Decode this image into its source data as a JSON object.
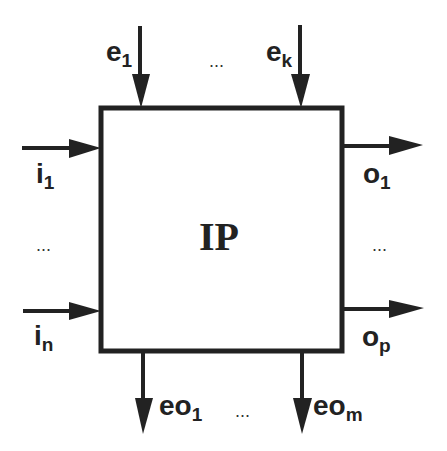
{
  "diagram": {
    "block": {
      "label": "IP"
    },
    "event_inputs": [
      {
        "base": "e",
        "sub": "1"
      },
      {
        "base": "e",
        "sub": "k"
      }
    ],
    "data_inputs": [
      {
        "base": "i",
        "sub": "1"
      },
      {
        "base": "i",
        "sub": "n"
      }
    ],
    "data_outputs": [
      {
        "base": "o",
        "sub": "1"
      },
      {
        "base": "o",
        "sub": "p"
      }
    ],
    "event_outputs": [
      {
        "base": "eo",
        "sub": "1"
      },
      {
        "base": "eo",
        "sub": "m"
      }
    ],
    "ellipsis": "...",
    "colors": {
      "stroke": "#222222",
      "background": "#ffffff"
    }
  }
}
